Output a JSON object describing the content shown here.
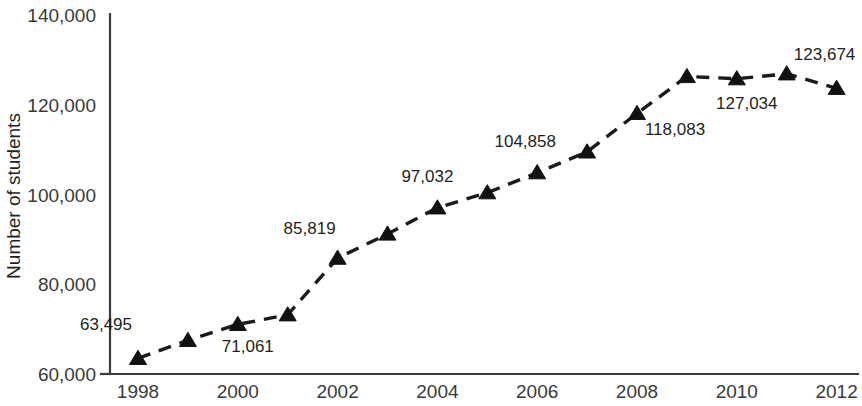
{
  "chart_data": {
    "type": "line",
    "title": "",
    "xlabel": "",
    "ylabel": "Number of students",
    "x": [
      1998,
      1999,
      2000,
      2001,
      2002,
      2003,
      2004,
      2005,
      2006,
      2007,
      2008,
      2009,
      2010,
      2011,
      2012
    ],
    "values": [
      63495,
      67500,
      71061,
      73200,
      85819,
      91200,
      97032,
      100400,
      104858,
      109500,
      118083,
      126300,
      125800,
      126900,
      123674
    ],
    "point_labels": [
      {
        "x": 1998,
        "value": 63495,
        "text": "63,495",
        "shown": true
      },
      {
        "x": 1999,
        "value": 67500,
        "text": "",
        "shown": false
      },
      {
        "x": 2000,
        "value": 71061,
        "text": "71,061",
        "shown": true
      },
      {
        "x": 2001,
        "value": 73200,
        "text": "",
        "shown": false
      },
      {
        "x": 2002,
        "value": 85819,
        "text": "85,819",
        "shown": true
      },
      {
        "x": 2003,
        "value": 91200,
        "text": "",
        "shown": false
      },
      {
        "x": 2004,
        "value": 97032,
        "text": "97,032",
        "shown": true
      },
      {
        "x": 2005,
        "value": 100400,
        "text": "",
        "shown": false
      },
      {
        "x": 2006,
        "value": 104858,
        "text": "104,858",
        "shown": true
      },
      {
        "x": 2007,
        "value": 109500,
        "text": "",
        "shown": false
      },
      {
        "x": 2008,
        "value": 118083,
        "text": "118,083",
        "shown": true
      },
      {
        "x": 2009,
        "value": 126300,
        "text": "",
        "shown": false
      },
      {
        "x": 2010,
        "value": 125800,
        "text": "127,034",
        "shown": true
      },
      {
        "x": 2011,
        "value": 126900,
        "text": "",
        "shown": false
      },
      {
        "x": 2012,
        "value": 123674,
        "text": "123,674",
        "shown": true
      }
    ],
    "xlim": [
      1997.4,
      2012.9
    ],
    "ylim": [
      60000,
      140000
    ],
    "ytick_labels": [
      "140,000",
      "120,000",
      "100,000",
      "80,000",
      "60,000"
    ],
    "ytick_values": [
      140000,
      120000,
      100000,
      80000,
      60000
    ],
    "xtick_labels": [
      "1998",
      "2000",
      "2002",
      "2004",
      "2006",
      "2008",
      "2010",
      "2012"
    ],
    "xtick_values": [
      1998,
      2000,
      2002,
      2004,
      2006,
      2008,
      2010,
      2012
    ],
    "grid": false,
    "legend": null,
    "marker": "triangle",
    "line_style": "dashed",
    "colors": {
      "line": "#1a1a1a",
      "marker": "#111111",
      "axis": "#3c3c3c",
      "text": "#231f20",
      "background": "#ffffff"
    }
  }
}
